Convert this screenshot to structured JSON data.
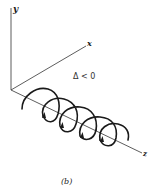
{
  "figure": {
    "caption": "(b)",
    "condition_label": "Δ < 0",
    "axes": {
      "y_label": "y",
      "x_label": "x",
      "z_label": "z"
    },
    "colors": {
      "line": "#1a1a1a",
      "axis": "#333333",
      "background": "#ffffff"
    }
  }
}
